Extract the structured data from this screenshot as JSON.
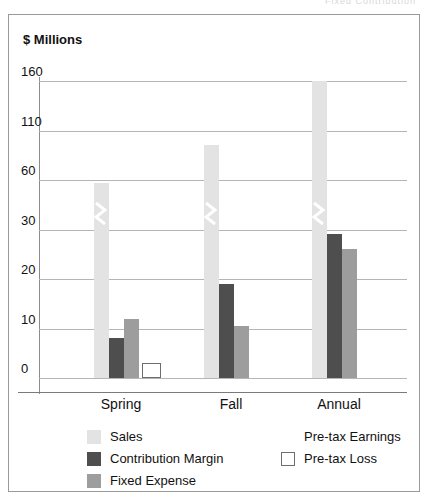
{
  "top_cut_text": "Fixed     Contribution",
  "axis_title": "$ Millions",
  "chart_data": {
    "type": "bar",
    "title": "",
    "subtitle": "",
    "xlabel": "",
    "ylabel": "$ Millions",
    "grid": true,
    "legend_position": "bottom",
    "axis_note": "broken (non-linear) y-axis: ticks equally spaced in pixels",
    "ytick_labels": [
      "0",
      "10",
      "20",
      "30",
      "60",
      "110",
      "160"
    ],
    "ytick_values": [
      0,
      10,
      20,
      30,
      60,
      110,
      160
    ],
    "ylim": [
      0,
      160
    ],
    "categories": [
      "Spring",
      "Fall",
      "Annual"
    ],
    "series": [
      {
        "name": "Sales",
        "color": "#e3e3e3",
        "values": [
          58,
          95,
          160
        ],
        "broken": [
          true,
          true,
          true
        ]
      },
      {
        "name": "Contribution Margin",
        "color": "#4e4e4e",
        "values": [
          8,
          19,
          29
        ]
      },
      {
        "name": "Fixed Expense",
        "color": "#9d9d9d",
        "values": [
          12,
          10.5,
          26
        ]
      },
      {
        "name": "Pre-tax Earnings",
        "color": "#ffffff",
        "values": [
          null,
          null,
          null
        ]
      },
      {
        "name": "Pre-tax Loss",
        "color": "#ffffff",
        "values": [
          3,
          null,
          null
        ]
      }
    ]
  },
  "legend": {
    "items": [
      {
        "label": "Sales",
        "swatch": "sales"
      },
      {
        "label": "Contribution Margin",
        "swatch": "cm"
      },
      {
        "label": "Fixed Expense",
        "swatch": "fe"
      },
      {
        "label": "Pre-tax Earnings",
        "swatch": "earn"
      },
      {
        "label": "Pre-tax Loss",
        "swatch": "loss"
      }
    ]
  }
}
